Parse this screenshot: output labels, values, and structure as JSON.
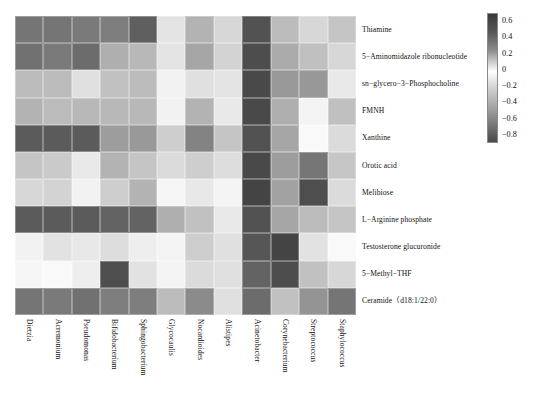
{
  "figure": {
    "type": "heatmap-figure",
    "background": "#ffffff"
  },
  "chart_data": {
    "type": "heatmap",
    "title": "",
    "xlabel": "",
    "ylabel": "",
    "colormap": "grayscale-diverging",
    "colorbar": {
      "position": "right",
      "ticks": [
        "0.6",
        "0.4",
        "0.2",
        "0",
        "-0.2",
        "-0.4",
        "-0.6",
        "-0.8"
      ],
      "vmin": -0.9,
      "vmax": 0.7
    },
    "grid": true,
    "legend_position": "right",
    "columns": [
      "Dietzia",
      "Acremonium",
      "Pseudomonas",
      "Bifidobacterium",
      "Sphingobacterium",
      "Glycocaulis",
      "Nocardioides",
      "Alistipes",
      "Acinetobacter",
      "Corynebacterium",
      "Streptococcus",
      "Staphylococcus"
    ],
    "rows": [
      "Thiamine",
      "5−Aminomidazole ribonucleotide",
      "sn−glycero−3−Phosphocholine",
      "FMNH",
      "Xanthine",
      "Orotic acid",
      "Melibiose",
      "L−Arginine phosphate",
      "Testosterone glucuronide",
      "5−Methyl−THF",
      "Ceramide（d18:1/22:0）"
    ],
    "values": [
      [
        -0.62,
        -0.62,
        -0.6,
        -0.58,
        -0.72,
        -0.12,
        -0.34,
        -0.18,
        -0.78,
        -0.3,
        -0.18,
        -0.26
      ],
      [
        -0.64,
        -0.6,
        -0.66,
        -0.36,
        -0.32,
        -0.12,
        -0.4,
        -0.2,
        -0.8,
        -0.38,
        0.22,
        -0.18
      ],
      [
        -0.3,
        -0.3,
        -0.14,
        -0.28,
        -0.3,
        -0.06,
        -0.14,
        -0.12,
        -0.82,
        -0.46,
        0.36,
        -0.1
      ],
      [
        -0.34,
        -0.3,
        -0.32,
        -0.32,
        -0.32,
        -0.06,
        -0.34,
        -0.1,
        -0.82,
        -0.36,
        0.04,
        0.22
      ],
      [
        -0.74,
        -0.74,
        -0.74,
        -0.44,
        -0.46,
        -0.22,
        -0.56,
        -0.26,
        -0.78,
        -0.4,
        0.02,
        -0.16
      ],
      [
        -0.26,
        -0.24,
        -0.1,
        -0.34,
        -0.26,
        -0.16,
        -0.22,
        0.12,
        -0.82,
        -0.44,
        0.48,
        0.2
      ],
      [
        -0.18,
        -0.2,
        -0.06,
        -0.22,
        -0.34,
        -0.04,
        0.08,
        0.04,
        -0.84,
        -0.42,
        0.62,
        -0.16
      ],
      [
        -0.74,
        -0.74,
        -0.74,
        -0.7,
        -0.7,
        -0.36,
        -0.28,
        -0.1,
        -0.78,
        -0.4,
        -0.3,
        -0.26
      ],
      [
        -0.06,
        0.1,
        0.08,
        0.12,
        0.06,
        0.04,
        -0.22,
        -0.14,
        -0.76,
        -0.84,
        0.1,
        0.02
      ],
      [
        -0.04,
        0.02,
        0.06,
        0.62,
        0.1,
        0.04,
        -0.16,
        -0.14,
        -0.7,
        -0.8,
        -0.28,
        0.14
      ],
      [
        -0.62,
        -0.6,
        -0.64,
        -0.58,
        -0.58,
        -0.3,
        -0.52,
        -0.14,
        -0.66,
        -0.28,
        -0.48,
        -0.62
      ]
    ]
  },
  "colorbar": {
    "labels": [
      "0.6",
      "0.4",
      "0.2",
      "0",
      "-0.2",
      "-0.4",
      "-0.6",
      "-0.8"
    ]
  }
}
